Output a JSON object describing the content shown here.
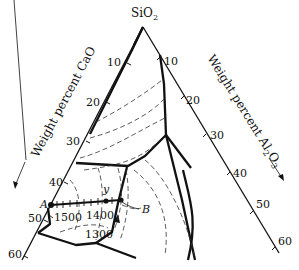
{
  "diagram": {
    "type": "ternary-phase-diagram",
    "apex_label": "SiO₂",
    "apex_main": "SiO",
    "apex_sub": "2",
    "left_axis_title": "Weight percent CaO",
    "right_axis_title_main": "Weight percent Al",
    "right_axis_sub1": "2",
    "right_axis_mid": "O",
    "right_axis_sub2": "3",
    "left_ticks": [
      "10",
      "20",
      "30",
      "40",
      "50",
      "60"
    ],
    "right_ticks": [
      "10",
      "20",
      "30",
      "40",
      "50",
      "60"
    ],
    "isotherms": [
      "1500",
      "1400",
      "1300"
    ],
    "points": {
      "A": "A",
      "B": "B",
      "y": "y"
    }
  }
}
